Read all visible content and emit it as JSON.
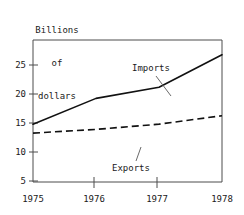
{
  "chart_data": {
    "type": "line",
    "title": "Billions of dollars",
    "title_lines": [
      "Billions",
      "of",
      "dollars"
    ],
    "xlabel": "",
    "ylabel": "Billions of dollars",
    "x": [
      1975,
      1976,
      1977,
      1978
    ],
    "xlim": [
      1975,
      1978
    ],
    "ylim": [
      0,
      27
    ],
    "xticks": [
      1975,
      1976,
      1977,
      1978
    ],
    "xtick_labels": [
      "1975",
      "1976",
      "1977",
      "1978"
    ],
    "yticks": [
      5,
      10,
      15,
      20,
      25
    ],
    "ytick_labels": [
      "25",
      "20",
      "15",
      "10",
      "5"
    ],
    "grid": false,
    "legend": "inline-annotations",
    "series": [
      {
        "name": "Imports",
        "style": "solid",
        "color": "#111111",
        "values": [
          11.0,
          15.9,
          18.0,
          24.2
        ]
      },
      {
        "name": "Exports",
        "style": "dashed",
        "color": "#111111",
        "values": [
          9.3,
          10.0,
          11.0,
          12.6
        ]
      }
    ],
    "annotations": [
      {
        "text": "Imports",
        "series": "Imports"
      },
      {
        "text": "Exports",
        "series": "Exports"
      }
    ]
  },
  "colors": {
    "axis": "#4d4d4d",
    "line": "#111111",
    "leader": "#6a6a6a",
    "background": "#ffffff"
  }
}
